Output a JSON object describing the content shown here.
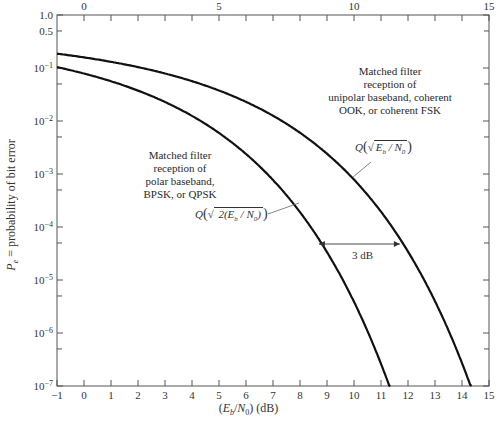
{
  "chart_data": {
    "type": "line",
    "title": "",
    "xlabel": "(E_b/N_0) (dB)",
    "ylabel": "P_e = probability of bit error",
    "x_scale": "linear",
    "y_scale": "log",
    "xlim": [
      -1,
      15
    ],
    "ylim": [
      1e-07,
      1.0
    ],
    "x_ticks": [
      -1,
      0,
      1,
      2,
      3,
      4,
      5,
      6,
      7,
      8,
      9,
      10,
      11,
      12,
      13,
      14,
      15
    ],
    "top_axis_ticks": [
      0,
      5,
      10,
      15
    ],
    "y_tick_labels": [
      "1.0",
      "0.5",
      "10^-1",
      "10^-2",
      "10^-3",
      "10^-4",
      "10^-5",
      "10^-6",
      "10^-7"
    ],
    "grid": false,
    "series": [
      {
        "name": "Matched filter reception of polar baseband, BPSK, or QPSK",
        "formula": "Q(sqrt(2(Eb/N0)))",
        "x": [
          -1,
          0,
          1,
          2,
          3,
          4,
          5,
          6,
          7,
          8,
          9,
          10,
          11,
          11.3
        ],
        "y": [
          0.104,
          0.0786,
          0.0563,
          0.0375,
          0.0229,
          0.0125,
          0.00595,
          0.00239,
          0.000773,
          0.000191,
          3.36e-05,
          3.87e-06,
          2.61e-07,
          1e-07
        ]
      },
      {
        "name": "Matched filter reception of unipolar baseband, coherent OOK, or coherent FSK",
        "formula": "Q(sqrt(Eb/N0))",
        "x": [
          -1,
          0,
          1,
          2,
          3,
          4,
          5,
          6,
          7,
          8,
          9,
          10,
          11,
          12,
          13,
          14,
          14.3
        ],
        "y": [
          0.186,
          0.159,
          0.131,
          0.104,
          0.0786,
          0.0563,
          0.0375,
          0.0229,
          0.0125,
          0.00595,
          0.00239,
          0.000773,
          0.000191,
          3.36e-05,
          3.87e-06,
          2.61e-07,
          1e-07
        ]
      }
    ],
    "annotations": [
      {
        "text": "3 dB",
        "type": "double-arrow",
        "from_x": 8.7,
        "to_x": 11.7,
        "y": 8e-05
      }
    ]
  },
  "labels": {
    "y_axis": "P_e = probability of bit error",
    "x_axis_main": "(E",
    "x_axis_sub": "b",
    "x_axis_mid": "/N",
    "x_axis_sub2": "0",
    "x_axis_end": ") (dB)",
    "ann_unipolar": [
      "Matched filter",
      "reception of",
      "unipolar baseband, coherent",
      "OOK, or coherent FSK"
    ],
    "ann_polar": [
      "Matched filter",
      "reception of",
      "polar baseband,",
      "BPSK, or QPSK"
    ],
    "q_unipolar": "Q(√ E_b / N_0 )",
    "q_polar": "Q(√ 2(E_b / N_0) )",
    "three_db": "3 dB"
  }
}
